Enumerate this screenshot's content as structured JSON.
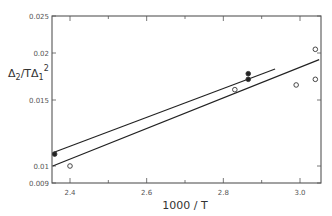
{
  "chart_data": {
    "type": "scatter",
    "title": "",
    "xlabel": "1000 / T",
    "ylabel": "Δ2 / TΔ1²",
    "ylabel_parts": {
      "main": "Δ",
      "sub": "2",
      "mid": "/TΔ",
      "sub2": "1",
      "sup": "2"
    },
    "xlim": [
      2.35,
      3.05
    ],
    "ylim": [
      0.009,
      0.025
    ],
    "x_ticks": [
      2.4,
      2.6,
      2.8,
      3.0
    ],
    "x_tick_labels": [
      "2.4",
      "2.6",
      "2.8",
      "3.0"
    ],
    "y_ticks": [
      0.009,
      0.01,
      0.015,
      0.02,
      0.025
    ],
    "y_tick_labels": [
      "0.009",
      "0.01",
      "0.015",
      "0.02",
      "0.025"
    ],
    "grid": false,
    "legend": null,
    "series": [
      {
        "name": "filled",
        "marker": "filled-circle",
        "points": [
          {
            "x": 2.36,
            "y": 0.0109
          },
          {
            "x": 2.865,
            "y": 0.0178
          },
          {
            "x": 2.865,
            "y": 0.0172
          }
        ]
      },
      {
        "name": "open",
        "marker": "open-circle",
        "points": [
          {
            "x": 2.4,
            "y": 0.01
          },
          {
            "x": 2.83,
            "y": 0.0161
          },
          {
            "x": 2.99,
            "y": 0.0166
          },
          {
            "x": 3.04,
            "y": 0.0205
          },
          {
            "x": 3.04,
            "y": 0.0172
          }
        ]
      }
    ],
    "fit_lines": [
      {
        "name": "upper-fit",
        "x": [
          2.355,
          2.935
        ],
        "y": [
          0.011,
          0.0183
        ]
      },
      {
        "name": "lower-fit",
        "x": [
          2.355,
          3.05
        ],
        "y": [
          0.01,
          0.0193
        ]
      }
    ]
  }
}
